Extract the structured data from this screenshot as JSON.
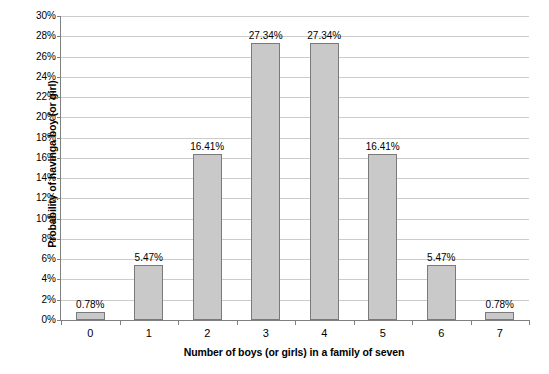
{
  "chart_data": {
    "type": "bar",
    "title": "",
    "subtitle": "",
    "xlabel": "Number of boys (or girls) in a family of seven",
    "ylabel": "Probability of havinga boy (or girl)",
    "categories": [
      "0",
      "1",
      "2",
      "3",
      "4",
      "5",
      "6",
      "7"
    ],
    "values": [
      0.78,
      5.47,
      16.41,
      27.34,
      27.34,
      16.41,
      5.47,
      0.78
    ],
    "data_labels": [
      "0.78%",
      "5.47%",
      "16.41%",
      "27.34%",
      "27.34%",
      "16.41%",
      "5.47%",
      "0.78%"
    ],
    "ylim": [
      0,
      30
    ],
    "ytick_step": 2,
    "ytick_labels": [
      "0%",
      "2%",
      "4%",
      "6%",
      "8%",
      "10%",
      "12%",
      "14%",
      "16%",
      "18%",
      "20%",
      "22%",
      "24%",
      "26%",
      "28%",
      "30%"
    ],
    "ytick_values": [
      0,
      2,
      4,
      6,
      8,
      10,
      12,
      14,
      16,
      18,
      20,
      22,
      24,
      26,
      28,
      30
    ],
    "grid": {
      "horizontal": true,
      "vertical": false
    },
    "legend": {
      "visible": false,
      "position": "none"
    },
    "colors": {
      "bar_fill": "#c9c9c9",
      "bar_border": "#7a7a7a",
      "gridline": "#cccccc",
      "axis": "#808080",
      "text": "#000000",
      "background": "#ffffff"
    }
  }
}
